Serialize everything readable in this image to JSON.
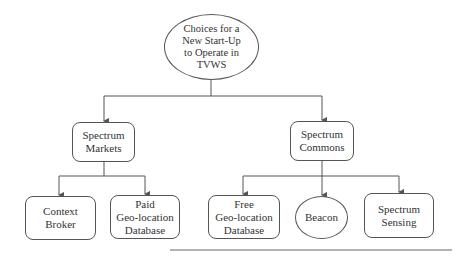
{
  "diagram": {
    "root": {
      "label": "Choices for a\nNew Start-Up\nto Operate in\nTVWS"
    },
    "branches": [
      {
        "label": "Spectrum\nMarkets",
        "children": [
          {
            "label": "Context\nBroker"
          },
          {
            "label": "Paid\nGeo-location\nDatabase"
          }
        ]
      },
      {
        "label": "Spectrum\nCommons",
        "children": [
          {
            "label": "Free\nGeo-location\nDatabase"
          },
          {
            "label": "Beacon"
          },
          {
            "label": "Spectrum\nSensing"
          }
        ]
      }
    ]
  },
  "colors": {
    "line": "#555555",
    "text": "#333333",
    "background": "#ffffff"
  }
}
